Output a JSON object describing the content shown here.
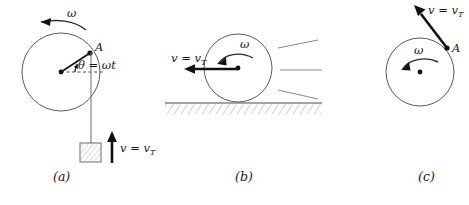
{
  "figure": {
    "background_color": "#ffffff",
    "ink_color": "#1a1a1a"
  },
  "panels": [
    {
      "id": "a",
      "label": "(a)",
      "label_x": 53,
      "label_y": 181,
      "omega_label": "ω",
      "omega_label_x": 67,
      "omega_label_y": 17,
      "point_label": "A",
      "point_label_x": 95,
      "point_label_y": 51,
      "angle_label": "θ = ωt",
      "angle_label_x": 78,
      "angle_label_y": 69,
      "velocity_label": "v = v",
      "velocity_subscript": "T",
      "velocity_label_x": 120,
      "velocity_label_y": 152,
      "circle": {
        "cx": 61,
        "cy": 72,
        "r": 39
      },
      "point_a": {
        "x": 90,
        "y": 53
      },
      "block": {
        "x": 80,
        "y": 143,
        "w": 21,
        "h": 19
      },
      "cord": {
        "x": 91,
        "y1": 52,
        "y2": 143
      }
    },
    {
      "id": "b",
      "label": "(b)",
      "label_x": 235,
      "label_y": 181,
      "omega_label": "ω",
      "omega_label_x": 240,
      "omega_label_y": 48,
      "velocity_label": "v = v",
      "velocity_subscript": "T",
      "velocity_label_x": 171,
      "velocity_label_y": 62,
      "circle": {
        "cx": 238,
        "cy": 68,
        "r": 34
      },
      "ground": {
        "x1": 165,
        "x2": 322,
        "y": 103
      },
      "velocity_arrow": {
        "x1": 238,
        "y1": 69,
        "x2": 186,
        "y2": 69
      },
      "speed_lines": 3
    },
    {
      "id": "c",
      "label": "(c)",
      "label_x": 418,
      "label_y": 181,
      "omega_label": "ω",
      "omega_label_x": 418,
      "omega_label_y": 54,
      "point_label": "A",
      "point_label_x": 452,
      "point_label_y": 52,
      "velocity_label": "v = v",
      "velocity_subscript": "T",
      "velocity_label_x": 428,
      "velocity_label_y": 14,
      "circle": {
        "cx": 420,
        "cy": 72,
        "r": 34
      },
      "point_a": {
        "x": 447,
        "y": 48
      },
      "velocity_arrow": {
        "x1": 447,
        "y1": 48,
        "x2": 416,
        "y2": 8
      }
    }
  ]
}
